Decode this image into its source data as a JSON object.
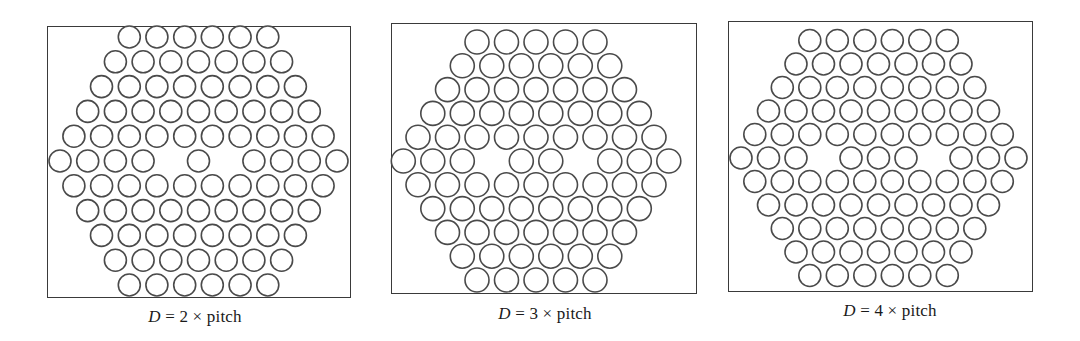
{
  "figure": {
    "panels": [
      {
        "id": "panel-d2",
        "caption": {
          "variable": "D",
          "equals": " = ",
          "multiplier": "2",
          "times": " × ",
          "unit": "pitch"
        },
        "defect_separation_pitches": 2,
        "frame": {
          "left": 47,
          "top": 26,
          "right": 351,
          "bottom": 298
        },
        "lattice": {
          "center_x": 198.5,
          "center_y": 161,
          "pitch_x": 27.7,
          "row_spacing": 24.8,
          "hole_diameter": 22,
          "rows": [
            6,
            7,
            8,
            9,
            10,
            11,
            10,
            9,
            8,
            7,
            6
          ],
          "missing_in_middle_row": [
            4,
            6
          ]
        },
        "caption_pos": {
          "x": 195,
          "y": 307
        }
      },
      {
        "id": "panel-d3",
        "caption": {
          "variable": "D",
          "equals": " = ",
          "multiplier": "3",
          "times": " × ",
          "unit": "pitch"
        },
        "defect_separation_pitches": 3,
        "frame": {
          "left": 391,
          "top": 23,
          "right": 697,
          "bottom": 294
        },
        "lattice": {
          "center_x": 536,
          "center_y": 161,
          "pitch_x": 29.5,
          "row_spacing": 23.8,
          "hole_diameter": 24,
          "rows": [
            5,
            6,
            7,
            8,
            9,
            10,
            9,
            8,
            7,
            6,
            5
          ],
          "missing_in_middle_row": [
            3,
            6
          ]
        },
        "caption_pos": {
          "x": 545,
          "y": 304
        }
      },
      {
        "id": "panel-d4",
        "caption": {
          "variable": "D",
          "equals": " = ",
          "multiplier": "4",
          "times": " × ",
          "unit": "pitch"
        },
        "defect_separation_pitches": 4,
        "frame": {
          "left": 728,
          "top": 21,
          "right": 1033,
          "bottom": 292
        },
        "lattice": {
          "center_x": 878.5,
          "center_y": 158,
          "pitch_x": 27.5,
          "row_spacing": 23.5,
          "hole_diameter": 22,
          "rows": [
            6,
            7,
            8,
            9,
            10,
            11,
            10,
            9,
            8,
            7,
            6
          ],
          "missing_in_middle_row": [
            3,
            7
          ]
        },
        "caption_pos": {
          "x": 890,
          "y": 301
        }
      }
    ],
    "colors": {
      "frame_stroke": "#3a3a3a",
      "hole_stroke": "#4a4a4a",
      "hole_fill": "#ffffff",
      "background": "#ffffff",
      "text": "#1a1a1a"
    }
  }
}
